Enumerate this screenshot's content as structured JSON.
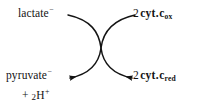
{
  "diagram": {
    "type": "coupled-reaction-crossed-arrows",
    "title_text": "",
    "background_color": "#ffffff",
    "stroke_color": "#141414",
    "labels": {
      "top_left": {
        "name": "lactate",
        "base": "lactate",
        "charge": "−",
        "full_text": "lactate⁻"
      },
      "top_right": {
        "name": "oxidized-cytochrome-c",
        "coefficient": "2",
        "base": "cyt",
        "separator": ".",
        "species": "c",
        "state": "ox",
        "full_text": "2 cyt.cₒₓ"
      },
      "bottom_left": {
        "name": "pyruvate",
        "base": "pyruvate",
        "charge": "−",
        "full_text": "pyruvate⁻",
        "second_line": {
          "name": "protons",
          "plus": "+",
          "coefficient": "2",
          "element": "H",
          "charge": "+",
          "full_text": "+ 2H⁺"
        }
      },
      "bottom_right": {
        "name": "reduced-cytochrome-c",
        "coefficient": "2",
        "base": "cyt",
        "separator": ".",
        "species": "c",
        "state": "red",
        "full_text": "2 cyt.cᵣₑₔ"
      }
    },
    "arrows": [
      {
        "name": "lactate-to-pyruvate-arrow",
        "from": "lactate⁻",
        "to": "pyruvate⁻ + 2H⁺",
        "direction": "top-right-to-bottom-left",
        "path": "M 135 15 C 112 20, 103 32, 101 48 C 99 64, 90 74, 70 78",
        "arrowhead_at": "end"
      },
      {
        "name": "cytochrome-ox-to-red-arrow",
        "from": "2 cyt.c(ox)",
        "to": "2 cyt.c(red)",
        "direction": "top-left-to-bottom-right",
        "path": "M 68 15 C 91 20, 99 32, 101 48 C 103 64, 112 74, 132 78",
        "arrowhead_at": "end"
      }
    ]
  }
}
